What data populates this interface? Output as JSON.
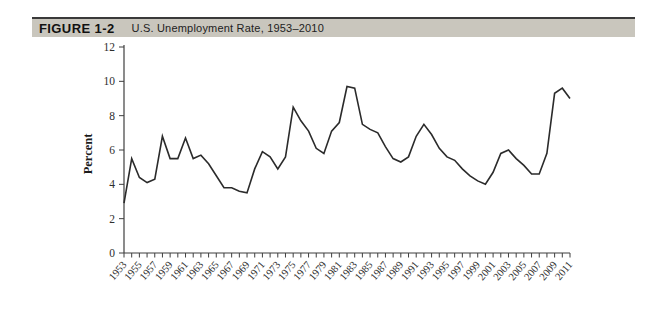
{
  "figure_header": {
    "label": "FIGURE 1-2",
    "title": "U.S. Unemployment Rate, 1953–2010"
  },
  "chart_data": {
    "type": "line",
    "title": "U.S. Unemployment Rate, 1953–2010",
    "xlabel": "",
    "ylabel": "Percent",
    "ylim": [
      0,
      12
    ],
    "y_ticks": [
      0,
      2,
      4,
      6,
      8,
      10,
      12
    ],
    "x_label_every": 2,
    "grid": false,
    "legend": "none",
    "x": [
      1953,
      1954,
      1955,
      1956,
      1957,
      1958,
      1959,
      1960,
      1961,
      1962,
      1963,
      1964,
      1965,
      1966,
      1967,
      1968,
      1969,
      1970,
      1971,
      1972,
      1973,
      1974,
      1975,
      1976,
      1977,
      1978,
      1979,
      1980,
      1981,
      1982,
      1983,
      1984,
      1985,
      1986,
      1987,
      1988,
      1989,
      1990,
      1991,
      1992,
      1993,
      1994,
      1995,
      1996,
      1997,
      1998,
      1999,
      2000,
      2001,
      2002,
      2003,
      2004,
      2005,
      2006,
      2007,
      2008,
      2009,
      2010,
      2011
    ],
    "series": [
      {
        "name": "U.S. unemployment rate (percent)",
        "values": [
          2.9,
          5.5,
          4.4,
          4.1,
          4.3,
          6.8,
          5.5,
          5.5,
          6.7,
          5.5,
          5.7,
          5.2,
          4.5,
          3.8,
          3.8,
          3.6,
          3.5,
          4.9,
          5.9,
          5.6,
          4.9,
          5.6,
          8.5,
          7.7,
          7.1,
          6.1,
          5.8,
          7.1,
          7.6,
          9.7,
          9.6,
          7.5,
          7.2,
          7.0,
          6.2,
          5.5,
          5.3,
          5.6,
          6.8,
          7.5,
          6.9,
          6.1,
          5.6,
          5.4,
          4.9,
          4.5,
          4.2,
          4.0,
          4.7,
          5.8,
          6.0,
          5.5,
          5.1,
          4.6,
          4.6,
          5.8,
          9.3,
          9.6,
          9.0
        ]
      }
    ],
    "line_color": "#2b2b2b"
  },
  "colors": {
    "background": "#ffffff",
    "header_band": "#c9c6bd",
    "header_rule": "#3a3a3a",
    "axis": "#3f3f3f",
    "tick_text": "#2e2e2e"
  }
}
